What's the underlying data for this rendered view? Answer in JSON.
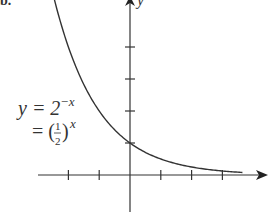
{
  "panel_label": "b.",
  "chart_data": {
    "type": "line",
    "title": "",
    "xlabel": "",
    "ylabel": "y",
    "equation": {
      "line1": "y = 2",
      "line1_exp": "−x",
      "line2": "= (",
      "frac_num": "1",
      "frac_den": "2",
      "line2_close": ")",
      "line2_exp": "x"
    },
    "series": [
      {
        "name": "y = 2^(-x)",
        "x": [
          -2.5,
          -2,
          -1.5,
          -1,
          -0.5,
          0,
          0.5,
          1,
          1.5,
          2,
          2.5,
          3,
          3.5
        ],
        "values": [
          5.66,
          4,
          2.83,
          2,
          1.41,
          1,
          0.71,
          0.5,
          0.35,
          0.25,
          0.18,
          0.125,
          0.09
        ]
      }
    ],
    "x_ticks": [
      -2,
      -1,
      1,
      2,
      3
    ],
    "y_ticks": [
      1,
      2,
      3,
      4
    ],
    "xlim": [
      -3.3,
      4.5
    ],
    "ylim": [
      -1.5,
      5.5
    ],
    "grid": false,
    "legend": null,
    "color": "#333333"
  }
}
